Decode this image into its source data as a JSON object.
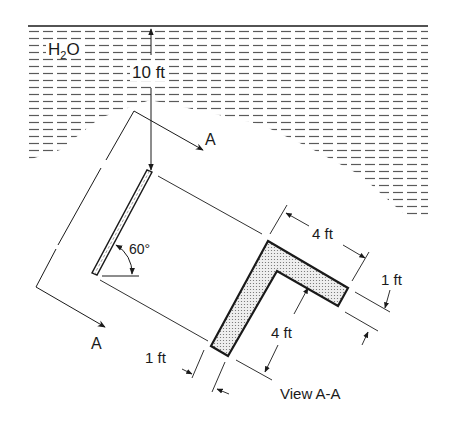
{
  "figure": {
    "fluid_label": {
      "main": "H",
      "subscript": "2",
      "tail": "O"
    },
    "depth_dimension": "10 ft",
    "angle_label": "60°",
    "section_marker_top": "A",
    "section_marker_bottom": "A",
    "view_caption": "View A-A",
    "dimensions": {
      "top_leg_length": "4 ft",
      "top_leg_thickness": "1 ft",
      "vertical_leg_length": "4 ft",
      "vertical_leg_thickness": "1 ft"
    },
    "colors": {
      "line": "#1a1a1a",
      "hatch": "#555555",
      "fill_dots": "#6a6a6a",
      "background": "#ffffff"
    }
  }
}
